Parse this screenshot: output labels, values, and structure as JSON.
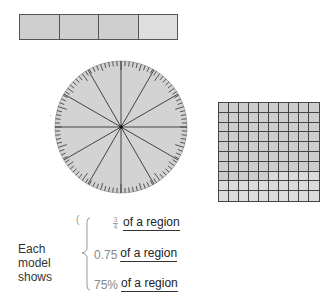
{
  "models": {
    "bar": {
      "segments": 4,
      "shaded": 3,
      "shaded_color": "#cfcfcf",
      "unshaded_color": "#dedede"
    },
    "circle": {
      "spokes": 12,
      "ticks": 100,
      "fill_color": "#d3d3d3",
      "line_color": "#444444"
    },
    "grid": {
      "rows": 10,
      "cols": 10,
      "shaded": 75,
      "shaded_color": "#cdcdcd",
      "unshaded_color": "#dcdcdc"
    }
  },
  "caption": {
    "line1": "Each model",
    "line2": "shows"
  },
  "representations": [
    {
      "type": "fraction",
      "numerator": "3",
      "denominator": "4",
      "suffix": "of a region"
    },
    {
      "type": "decimal",
      "value": "0.75",
      "suffix": "of a region"
    },
    {
      "type": "percent",
      "value": "75%",
      "suffix": "of a region"
    }
  ],
  "stray_mark": "("
}
